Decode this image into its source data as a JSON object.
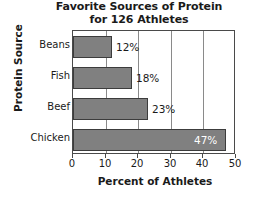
{
  "chart_data": {
    "type": "bar",
    "orientation": "horizontal",
    "title": "Favorite Sources of Protein for 126 Athletes",
    "title_lines": [
      "Favorite Sources of Protein",
      "for 126 Athletes"
    ],
    "xlabel": "Percent of Athletes",
    "ylabel": "Protein Source",
    "categories": [
      "Beans",
      "Fish",
      "Beef",
      "Chicken"
    ],
    "values": [
      12,
      18,
      23,
      47
    ],
    "value_labels": [
      "12%",
      "18%",
      "23%",
      "47%"
    ],
    "xlim": [
      0,
      50
    ],
    "xticks": [
      0,
      10,
      20,
      30,
      40,
      50
    ],
    "xtick_labels": [
      "0",
      "10",
      "20",
      "30",
      "40",
      "50"
    ],
    "grid": true,
    "grid_axis": "x",
    "legend": false,
    "bar_color": "#808080",
    "bar_edge_color": "#3c3c3c",
    "label_inside_color": "#ffffff",
    "label_outside_color": "#1a1a1a",
    "axis_color": "#4a4a4a",
    "background": "#ffffff"
  }
}
